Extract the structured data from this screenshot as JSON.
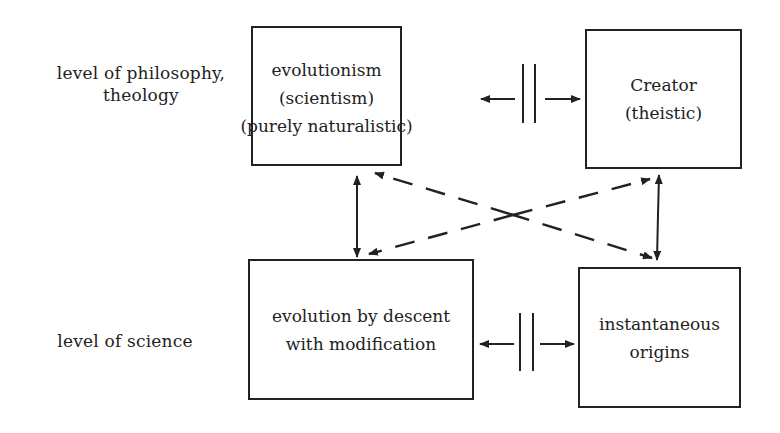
{
  "levels": {
    "philosophy": [
      "level of philosophy,",
      "theology"
    ],
    "science": "level of science"
  },
  "boxes": {
    "top_left": [
      "evolutionism",
      "(scientism)",
      "(purely naturalistic)"
    ],
    "top_right": [
      "Creator",
      "(theistic)"
    ],
    "bottom_left": [
      "evolution by descent",
      "with modification"
    ],
    "bottom_right": [
      "instantaneous",
      "origins"
    ]
  },
  "relations": [
    {
      "from": "top_left",
      "to": "top_right",
      "type": "incompatible",
      "symbol": "||"
    },
    {
      "from": "bottom_left",
      "to": "bottom_right",
      "type": "incompatible",
      "symbol": "||"
    },
    {
      "from": "top_left",
      "to": "bottom_left",
      "type": "bidirectional-solid"
    },
    {
      "from": "top_right",
      "to": "bottom_right",
      "type": "bidirectional-solid"
    },
    {
      "from": "top_left",
      "to": "bottom_right",
      "type": "bidirectional-dashed"
    },
    {
      "from": "top_right",
      "to": "bottom_left",
      "type": "bidirectional-dashed"
    }
  ]
}
